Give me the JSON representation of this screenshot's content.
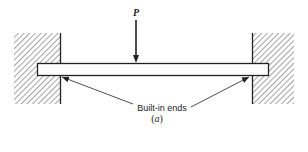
{
  "figure": {
    "load_label": "P",
    "annotation": "Built-in ends",
    "caption_open": "(",
    "caption_letter": "a",
    "caption_close": ")"
  },
  "colors": {
    "ink": "#222222",
    "background": "#ffffff"
  }
}
